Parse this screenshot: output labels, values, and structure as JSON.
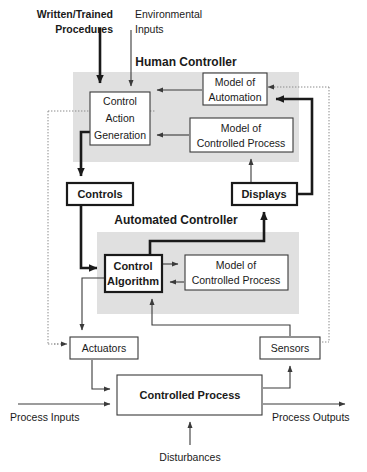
{
  "diagram": {
    "type": "block-diagram",
    "width": 367,
    "height": 472,
    "colors": {
      "background": "#ffffff",
      "shaded_region": "#e0e0e0",
      "line": "#1a1a1a",
      "thin_line": "#3a3a3a",
      "dotted_boundary": "#8a8a8a",
      "text": "#1a1a1a"
    }
  },
  "regions": [
    {
      "id": "human-controller",
      "title": "Human Controller",
      "title_x": 186,
      "title_y": 66,
      "shade": {
        "x": 73,
        "y": 72,
        "w": 226,
        "h": 90
      }
    },
    {
      "id": "automated-controller",
      "title": "Automated Controller",
      "title_x": 176,
      "title_y": 224,
      "shade": {
        "x": 97,
        "y": 232,
        "w": 202,
        "h": 82
      }
    }
  ],
  "boxes": [
    {
      "id": "control-action-generation",
      "name": "control-action-generation-box",
      "lines": [
        "Control",
        "Action",
        "Generation"
      ],
      "x": 90,
      "y": 92,
      "w": 60,
      "h": 53,
      "style": "thin",
      "bold": false
    },
    {
      "id": "model-of-automation",
      "name": "model-of-automation-box",
      "lines": [
        "Model of",
        "Automation"
      ],
      "x": 203,
      "y": 73,
      "w": 64,
      "h": 32,
      "style": "thin",
      "bold": false
    },
    {
      "id": "model-of-controlled-process-human",
      "name": "model-of-controlled-process-human-box",
      "lines": [
        "Model of",
        "Controlled Process"
      ],
      "x": 190,
      "y": 118,
      "w": 103,
      "h": 34,
      "style": "thin",
      "bold": false
    },
    {
      "id": "controls",
      "name": "controls-box",
      "lines": [
        "Controls"
      ],
      "x": 67,
      "y": 183,
      "w": 66,
      "h": 22,
      "style": "thick",
      "bold": true
    },
    {
      "id": "displays",
      "name": "displays-box",
      "lines": [
        "Displays"
      ],
      "x": 232,
      "y": 183,
      "w": 65,
      "h": 22,
      "style": "thick",
      "bold": true
    },
    {
      "id": "control-algorithm",
      "name": "control-algorithm-box",
      "lines": [
        "Control",
        "Algorithm"
      ],
      "x": 105,
      "y": 255,
      "w": 57,
      "h": 37,
      "style": "thick",
      "bold": true
    },
    {
      "id": "model-of-controlled-process-auto",
      "name": "model-of-controlled-process-auto-box",
      "lines": [
        "Model of",
        "Controlled Process"
      ],
      "x": 185,
      "y": 255,
      "w": 103,
      "h": 35,
      "style": "thin",
      "bold": false
    },
    {
      "id": "actuators",
      "name": "actuators-box",
      "lines": [
        "Actuators"
      ],
      "x": 70,
      "y": 337,
      "w": 68,
      "h": 22,
      "style": "thin",
      "bold": false
    },
    {
      "id": "sensors",
      "name": "sensors-box",
      "lines": [
        "Sensors"
      ],
      "x": 260,
      "y": 337,
      "w": 60,
      "h": 22,
      "style": "thin",
      "bold": false
    },
    {
      "id": "controlled-process",
      "name": "controlled-process-box",
      "lines": [
        "Controlled Process"
      ],
      "x": 117,
      "y": 375,
      "w": 145,
      "h": 40,
      "style": "thin",
      "bold": true
    }
  ],
  "external_labels": [
    {
      "id": "written-trained-procedures",
      "name": "written-trained-procedures-label",
      "lines": [
        "Written/Trained",
        "Procedures"
      ],
      "x": 73,
      "y": 18,
      "anchor": "end",
      "bold": true
    },
    {
      "id": "environmental-inputs",
      "name": "environmental-inputs-label",
      "lines": [
        "Environmental",
        "Inputs"
      ],
      "x": 126,
      "y": 18,
      "anchor": "start",
      "bold": false
    },
    {
      "id": "process-inputs",
      "name": "process-inputs-label",
      "lines": [
        "Process Inputs"
      ],
      "x": 8,
      "y": 419,
      "anchor": "start",
      "bold": false
    },
    {
      "id": "process-outputs",
      "name": "process-outputs-label",
      "lines": [
        "Process Outputs"
      ],
      "x": 274,
      "y": 419,
      "anchor": "start",
      "bold": false
    },
    {
      "id": "disturbances",
      "name": "disturbances-label",
      "lines": [
        "Disturbances"
      ],
      "x": 155,
      "y": 458,
      "anchor": "start",
      "bold": false
    }
  ],
  "connections": [
    {
      "id": "procedures-to-cag",
      "from": "written-trained-procedures",
      "to": "control-action-generation",
      "style": "thick"
    },
    {
      "id": "environmental-to-cag",
      "from": "environmental-inputs",
      "to": "control-action-generation",
      "style": "thin"
    },
    {
      "id": "model-automation-to-cag",
      "from": "model-of-automation",
      "to": "control-action-generation",
      "style": "thin"
    },
    {
      "id": "model-process-to-cag",
      "from": "model-of-controlled-process-human",
      "to": "control-action-generation",
      "style": "thin"
    },
    {
      "id": "cag-to-controls",
      "from": "control-action-generation",
      "to": "controls",
      "style": "thick"
    },
    {
      "id": "controls-to-control-algorithm",
      "from": "controls",
      "to": "control-algorithm",
      "style": "thick"
    },
    {
      "id": "control-algorithm-to-displays",
      "from": "control-algorithm",
      "to": "displays",
      "style": "thick"
    },
    {
      "id": "displays-to-model-automation",
      "from": "displays",
      "to": "model-of-automation",
      "style": "thick"
    },
    {
      "id": "displays-to-model-process",
      "from": "displays",
      "to": "model-of-controlled-process-human",
      "style": "thin"
    },
    {
      "id": "control-algorithm-to-model",
      "from": "control-algorithm",
      "to": "model-of-controlled-process-auto",
      "style": "thin"
    },
    {
      "id": "model-to-control-algorithm",
      "from": "model-of-controlled-process-auto",
      "to": "control-algorithm",
      "style": "thin"
    },
    {
      "id": "control-algorithm-to-actuators",
      "from": "control-algorithm",
      "to": "actuators",
      "style": "thin"
    },
    {
      "id": "sensors-to-control-algorithm",
      "from": "sensors",
      "to": "control-algorithm",
      "style": "thin"
    },
    {
      "id": "actuators-to-process",
      "from": "actuators",
      "to": "controlled-process",
      "style": "thin"
    },
    {
      "id": "process-to-sensors",
      "from": "controlled-process",
      "to": "sensors",
      "style": "thin"
    },
    {
      "id": "dotted-boundary-left",
      "from": "control-action-generation",
      "to": "actuators",
      "style": "dotted"
    },
    {
      "id": "dotted-boundary-right",
      "from": "sensors",
      "to": "model-of-automation",
      "style": "dotted"
    }
  ]
}
